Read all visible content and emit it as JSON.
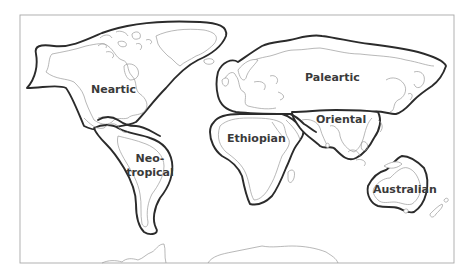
{
  "figure": {
    "regions": [
      {
        "id": "nearctic",
        "label_lines": [
          "Neartic"
        ]
      },
      {
        "id": "neotropical",
        "label_lines": [
          "Neo-",
          "tropical"
        ]
      },
      {
        "id": "palearctic",
        "label_lines": [
          "Paleartic"
        ]
      },
      {
        "id": "ethiopian",
        "label_lines": [
          "Ethiopian"
        ]
      },
      {
        "id": "oriental",
        "label_lines": [
          "Oriental"
        ]
      },
      {
        "id": "australian",
        "label_lines": [
          "Australian"
        ]
      }
    ]
  },
  "colors": {
    "region_border": "#2b2b2b",
    "coastline": "#9a9a9a",
    "frame": "#a8a8a8",
    "label_text": "#3a3a3a",
    "background": "#ffffff"
  }
}
